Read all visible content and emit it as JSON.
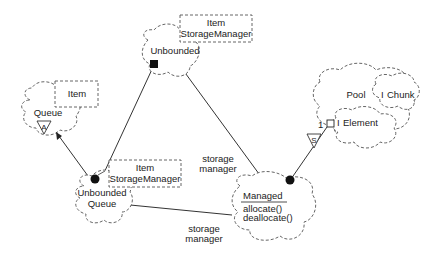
{
  "diagram": {
    "type": "Booch class diagram",
    "classes": {
      "unbounded": {
        "name": "Unbounded",
        "template_param": [
          "Item",
          "StorageManager"
        ]
      },
      "queue": {
        "name": "Queue",
        "template_param": [
          "Item"
        ],
        "adornment": "A"
      },
      "unbounded_queue": {
        "name_line1": "Unbounded",
        "name_line2": "Queue",
        "template_param": [
          "Item",
          "StorageManager"
        ]
      },
      "managed": {
        "name": "Managed",
        "operations": [
          "allocate()",
          "deallocate()"
        ]
      },
      "pool": {
        "name": "Pool",
        "chunk": "Chunk",
        "element": "Element",
        "chunk_prefix": "I",
        "element_prefix": "I"
      }
    },
    "relationships": [
      {
        "from": "unbounded_queue",
        "to": "unbounded",
        "kind": "has (filled square)"
      },
      {
        "from": "unbounded_queue",
        "to": "queue",
        "kind": "inherits (arrow)"
      },
      {
        "from": "unbounded",
        "to": "managed",
        "kind": "association",
        "label": "storage manager"
      },
      {
        "from": "unbounded_queue",
        "to": "managed",
        "kind": "association",
        "label": "storage manager"
      },
      {
        "from": "managed",
        "to": "pool",
        "kind": "has",
        "cardinality": "1",
        "adornment": "S"
      }
    ],
    "labels": {
      "assoc1_line1": "storage",
      "assoc1_line2": "manager",
      "assoc2_line1": "storage",
      "assoc2_line2": "manager",
      "cardinality": "1",
      "static_adornment": "S",
      "abstract_adornment": "A"
    }
  }
}
